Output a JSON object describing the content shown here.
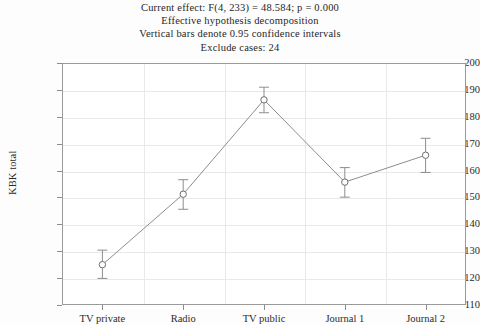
{
  "title": {
    "lines": [
      "Current effect: F(4, 233) = 48.584; p = 0.000",
      "Effective hypothesis decomposition",
      "Vertical bars denote 0.95 confidence intervals",
      "Exclude cases: 24"
    ]
  },
  "chart_data": {
    "type": "line",
    "title": "Current effect: F(4, 233) = 48.584; p = 0.000",
    "subtitle": "Effective hypothesis decomposition",
    "note": "Vertical bars denote 0.95 confidence intervals",
    "note2": "Exclude cases: 24",
    "xlabel": "",
    "ylabel": "KBK total",
    "categories": [
      "TV private",
      "Radio",
      "TV public",
      "Journal 1",
      "Journal 2"
    ],
    "values": [
      125.0,
      151.2,
      186.3,
      155.7,
      165.7
    ],
    "error_low": [
      119.9,
      145.6,
      181.5,
      150.1,
      159.3
    ],
    "error_high": [
      130.4,
      156.6,
      191.0,
      161.1,
      172.0
    ],
    "ylim": [
      110,
      200
    ],
    "yticks": [
      110,
      120,
      130,
      140,
      150,
      160,
      170,
      180,
      190,
      200
    ],
    "ytick_labels": [
      "110",
      "120",
      "130",
      "140",
      "150",
      "160",
      "170",
      "180",
      "190",
      "200"
    ],
    "grid": true,
    "legend": "none",
    "marker": "open-circle",
    "line_color": "#8d8d8d",
    "marker_edge_color": "#6f6f6f",
    "grid_color": "#e9e9e9",
    "frame_color": "#9a9a9a",
    "background": "#ffffff"
  }
}
